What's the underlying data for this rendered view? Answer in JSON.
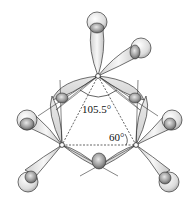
{
  "diagram": {
    "labels": {
      "bond_angle": "105.5°",
      "internuclear_angle": "60°"
    },
    "atoms": [
      {
        "name": "carbon-top",
        "x": 98,
        "y": 76
      },
      {
        "name": "carbon-left",
        "x": 62,
        "y": 145
      },
      {
        "name": "carbon-right",
        "x": 136,
        "y": 145
      }
    ],
    "colors": {
      "line": "#333333",
      "lobe_light": "#f4f4f4",
      "lobe_dark": "#bdbdbd",
      "background": "#ffffff"
    }
  }
}
